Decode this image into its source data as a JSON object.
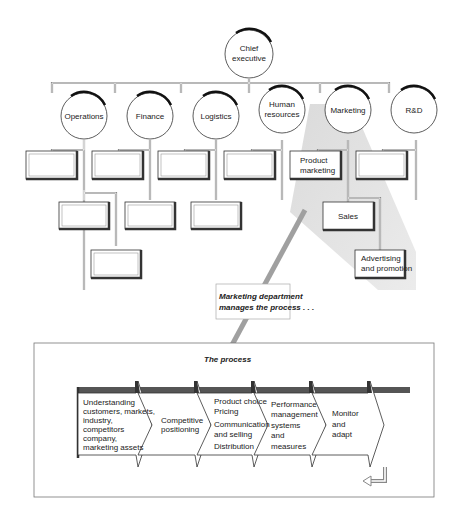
{
  "org_chart": {
    "root": {
      "label_lines": [
        "Chief",
        "executive"
      ]
    },
    "departments": [
      {
        "id": "operations",
        "label_lines": [
          "Operations"
        ]
      },
      {
        "id": "finance",
        "label_lines": [
          "Finance"
        ]
      },
      {
        "id": "logistics",
        "label_lines": [
          "Logistics"
        ]
      },
      {
        "id": "human-resources",
        "label_lines": [
          "Human",
          "resources"
        ]
      },
      {
        "id": "marketing",
        "label_lines": [
          "Marketing"
        ]
      },
      {
        "id": "rnd",
        "label_lines": [
          "R&D"
        ]
      }
    ],
    "marketing_units": [
      {
        "label_lines": [
          "Product",
          "marketing"
        ]
      },
      {
        "label_lines": [
          "Sales"
        ]
      },
      {
        "label_lines": [
          "Advertising",
          "and promotion"
        ]
      }
    ]
  },
  "callout": {
    "lines": [
      "Marketing department",
      "manages the process . . ."
    ]
  },
  "process": {
    "title": "The process",
    "steps": [
      {
        "lines": [
          "Understanding",
          "customers, markets,",
          "industry,",
          "competitors",
          "company,",
          "marketing assets"
        ]
      },
      {
        "lines": [
          "Competitive",
          "positioning"
        ]
      },
      {
        "lines": [
          "Product choice",
          "Pricing",
          "Communication",
          "and selling",
          "Distribution"
        ]
      },
      {
        "lines": [
          "Performance",
          "management",
          "systems",
          "and",
          "measures"
        ]
      },
      {
        "lines": [
          "Monitor",
          "and",
          "adapt"
        ]
      }
    ],
    "loop_icon": "return-arrow-icon"
  },
  "colors": {
    "connector": "#8a8a8a",
    "box_shadow": "#3a3a3a",
    "highlight": "#d8d8d8",
    "arrow_band": "#555555"
  }
}
